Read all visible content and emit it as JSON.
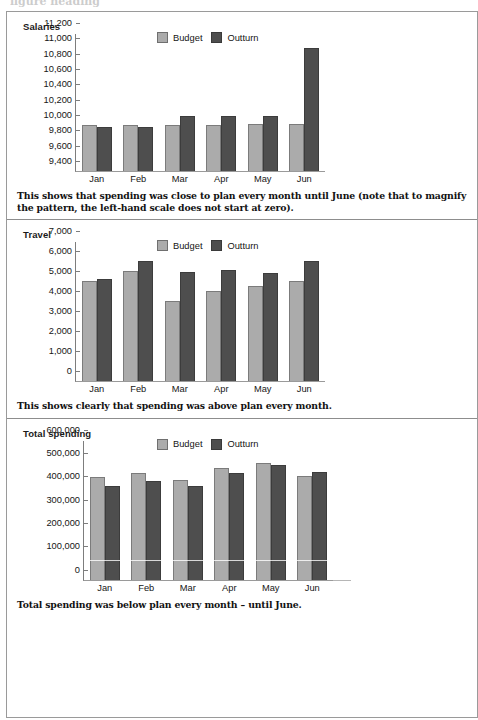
{
  "page": {
    "top_bleed_text": "figure heading"
  },
  "legend": {
    "budget_label": "Budget",
    "outturn_label": "Outturn",
    "budget_color": "#ababab",
    "outturn_color": "#4e4e4e"
  },
  "panels": [
    {
      "title": "Salaries",
      "caption": "This shows that spending was close to plan every month until June (note that to magnify the pattern, the left-hand scale does not start at zero)."
    },
    {
      "title": "Travel",
      "caption": "This shows clearly that spending was above plan every month."
    },
    {
      "title": "Total spending",
      "caption": "Total spending was below plan every month – until June."
    }
  ],
  "chart_data": [
    {
      "type": "bar",
      "title": "Salaries",
      "xlabel": "",
      "ylabel": "",
      "categories": [
        "Jan",
        "Feb",
        "Mar",
        "Apr",
        "May",
        "Jun"
      ],
      "series": [
        {
          "name": "Budget",
          "values": [
            10000,
            10000,
            10000,
            10000,
            10010,
            10010
          ]
        },
        {
          "name": "Outturn",
          "values": [
            9980,
            9975,
            10120,
            10120,
            10120,
            11010
          ]
        }
      ],
      "ylim": [
        9400,
        11200
      ],
      "yticks": [
        9400,
        9600,
        9800,
        10000,
        10200,
        10400,
        10600,
        10800,
        11000,
        11200
      ],
      "ytick_labels": [
        "9,400",
        "9,600",
        "9,800",
        "10,000",
        "10,200",
        "10,400",
        "10,600",
        "10,800",
        "11,000",
        "11,200"
      ],
      "grid": false,
      "legend_position": "top-center"
    },
    {
      "type": "bar",
      "title": "Travel",
      "xlabel": "",
      "ylabel": "",
      "categories": [
        "Jan",
        "Feb",
        "Mar",
        "Apr",
        "May",
        "Jun"
      ],
      "series": [
        {
          "name": "Budget",
          "values": [
            5000,
            5520,
            4000,
            4520,
            4760,
            5040
          ]
        },
        {
          "name": "Outturn",
          "values": [
            5120,
            6000,
            5470,
            5590,
            5430,
            6030
          ]
        }
      ],
      "ylim": [
        0,
        7000
      ],
      "yticks": [
        0,
        1000,
        2000,
        3000,
        4000,
        5000,
        6000,
        7000
      ],
      "ytick_labels": [
        "0",
        "1,000",
        "2,000",
        "3,000",
        "4,000",
        "5,000",
        "6,000",
        "7,000"
      ],
      "grid": false,
      "legend_position": "top-center"
    },
    {
      "type": "bar",
      "title": "Total spending",
      "xlabel": "",
      "ylabel": "",
      "categories": [
        "Jan",
        "Feb",
        "Mar",
        "Apr",
        "May",
        "Jun"
      ],
      "series": [
        {
          "name": "Budget",
          "values": [
            441000,
            455000,
            426000,
            478000,
            500000,
            442000
          ]
        },
        {
          "name": "Outturn",
          "values": [
            400000,
            424000,
            400000,
            457000,
            492000,
            462000
          ]
        }
      ],
      "ylim": [
        0,
        600000
      ],
      "yticks": [
        0,
        100000,
        200000,
        300000,
        400000,
        500000,
        600000
      ],
      "ytick_labels": [
        "0",
        "100,000",
        "200,000",
        "300,000",
        "400,000",
        "500,000",
        "600,000"
      ],
      "grid": false,
      "legend_position": "top-center"
    }
  ]
}
